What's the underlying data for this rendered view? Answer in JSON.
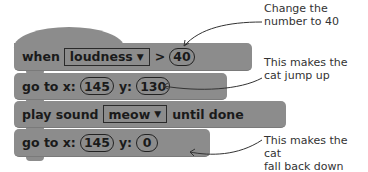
{
  "blocks": [
    {
      "type": "hat",
      "prefix": "when",
      "dropdown": "loudness",
      "operator": ">",
      "value": "40"
    },
    {
      "type": "motion",
      "label_x": "go to x:",
      "x": "145",
      "label_y": "y:",
      "y": "130"
    },
    {
      "type": "sound",
      "prefix": "play sound",
      "dropdown": "meow",
      "suffix": "until done"
    },
    {
      "type": "motion",
      "label_x": "go to x:",
      "x": "145",
      "label_y": "y:",
      "y": "0"
    }
  ],
  "annotations": [
    {
      "line1": "Change the",
      "line2": "number to 40"
    },
    {
      "line1": "This makes the",
      "line2": "cat jump up"
    },
    {
      "line1": "This makes the cat",
      "line2": "fall back down"
    }
  ],
  "icons": {
    "dropdown_arrow": "▼"
  },
  "colors": {
    "block": "#8c8c8c",
    "text": "#1a1a1a",
    "annotation": "#333333"
  }
}
